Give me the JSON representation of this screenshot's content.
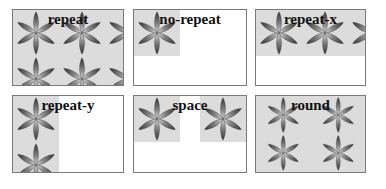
{
  "boxes": [
    {
      "label": "repeat",
      "mode": "repeat"
    },
    {
      "label": "no-repeat",
      "mode": "no-repeat"
    },
    {
      "label": "repeat-x",
      "mode": "repeat-x"
    },
    {
      "label": "repeat-y",
      "mode": "repeat-y"
    },
    {
      "label": "space",
      "mode": "space"
    },
    {
      "label": "round",
      "mode": "round"
    }
  ],
  "icon": "flower-icon",
  "colors": {
    "border": "#7a7a7a",
    "tile_background": "#dcdcdc",
    "label": "#111111"
  }
}
